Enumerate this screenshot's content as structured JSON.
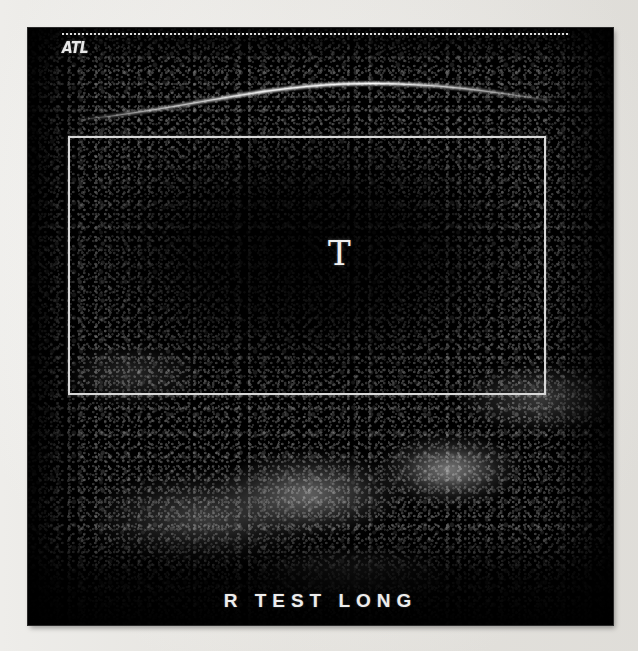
{
  "page": {
    "background_color": "#f6f5f3"
  },
  "ultrasound": {
    "frame": {
      "background_color": "#000000",
      "x": 28,
      "y": 28,
      "width": 585,
      "height": 597
    },
    "manufacturer_logo": {
      "text": "ATL",
      "color": "#e8e8e8",
      "position": "top-left"
    },
    "depth_scale_line": {
      "style": "dotted",
      "color": "#e6e6e6",
      "position": "top"
    },
    "region_of_interest": {
      "label": "roi-rectangle",
      "border_color": "#d8d8d8",
      "x": 68,
      "y": 136,
      "width": 478,
      "height": 259
    },
    "annotation_marker": {
      "text": "T",
      "color": "#f0f0f0",
      "meaning": "transverse-marker"
    },
    "caption": {
      "text": "R TEST LONG",
      "color": "#ededed"
    },
    "features": {
      "interface_arc_color": "#c8c8c8",
      "hypoechoic_region": "center",
      "echogenic_region": "lower-center-right"
    }
  }
}
